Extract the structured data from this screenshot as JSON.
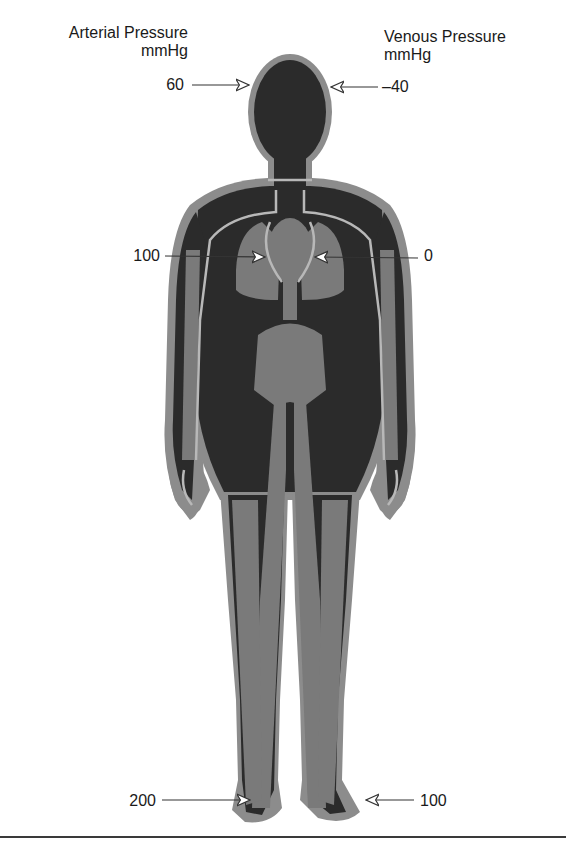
{
  "headers": {
    "arterial": {
      "title": "Arterial Pressure",
      "unit": "mmHg"
    },
    "venous": {
      "title": "Venous Pressure",
      "unit": "mmHg"
    }
  },
  "measurements": [
    {
      "site": "head",
      "arterial": "60",
      "venous": "–40"
    },
    {
      "site": "heart",
      "arterial": "100",
      "venous": "0"
    },
    {
      "site": "feet",
      "arterial": "200",
      "venous": "100"
    }
  ],
  "colors": {
    "body_dark": "#2b2b2b",
    "organ_gray": "#7a7a7a",
    "vessel_light": "#b8b8b8",
    "outline": "#8c8c8c",
    "arrow": "#333333",
    "text": "#1a1a1a"
  }
}
